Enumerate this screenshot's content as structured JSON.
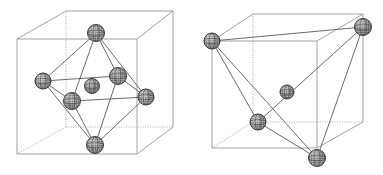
{
  "figure": {
    "background_color": "#ffffff",
    "width": 383,
    "height": 175,
    "colors": {
      "cube_edge_solid": "#8a8a8a",
      "cube_edge_dotted": "#9a9a9a",
      "polyhedron_edge": "#5a5a5a",
      "bond": "#555555",
      "atom_outline": "#2f2f2f",
      "atom_fill": "#b8b8b8"
    }
  },
  "panels": [
    {
      "id": "left",
      "name": "octahedral-site-panel",
      "label": "",
      "cube": {
        "name": "unit-cell-cube-left",
        "corners": {
          "front_top_left": [
            17,
            39
          ],
          "front_top_right": [
            137,
            39
          ],
          "front_bottom_left": [
            17,
            154
          ],
          "front_bottom_right": [
            137,
            154
          ],
          "back_top_left": [
            66,
            11
          ],
          "back_top_right": [
            173,
            11
          ],
          "back_bottom_left": [
            66,
            127
          ],
          "back_bottom_right": [
            173,
            127
          ]
        },
        "solid_edges": [
          [
            "front_top_left",
            "front_top_right"
          ],
          [
            "front_top_left",
            "front_bottom_left"
          ],
          [
            "front_bottom_left",
            "front_bottom_right"
          ],
          [
            "front_top_right",
            "front_bottom_right"
          ],
          [
            "front_top_left",
            "back_top_left"
          ],
          [
            "back_top_left",
            "back_top_right"
          ],
          [
            "front_top_right",
            "back_top_right"
          ],
          [
            "back_top_right",
            "back_bottom_right"
          ],
          [
            "front_bottom_right",
            "back_bottom_right"
          ]
        ],
        "dotted_edges": [
          [
            "back_top_left",
            "back_bottom_left"
          ],
          [
            "back_bottom_left",
            "back_bottom_right"
          ],
          [
            "front_bottom_left",
            "back_bottom_left"
          ]
        ]
      },
      "atoms": [
        {
          "name": "atom-face-top",
          "cx": 96,
          "cy": 33,
          "r": 8.5,
          "role": "vertex"
        },
        {
          "name": "atom-face-left",
          "cx": 43,
          "cy": 81,
          "r": 8.0,
          "role": "vertex"
        },
        {
          "name": "atom-face-front",
          "cx": 72,
          "cy": 101,
          "r": 8.5,
          "role": "vertex"
        },
        {
          "name": "atom-face-back",
          "cx": 118,
          "cy": 76,
          "r": 8.5,
          "role": "vertex"
        },
        {
          "name": "atom-face-right",
          "cx": 146,
          "cy": 97,
          "r": 8.0,
          "role": "vertex"
        },
        {
          "name": "atom-face-bottom",
          "cx": 95,
          "cy": 145,
          "r": 8.5,
          "role": "vertex"
        },
        {
          "name": "atom-center",
          "cx": 92,
          "cy": 86,
          "r": 7.5,
          "role": "center"
        }
      ],
      "polyhedron": {
        "type": "octahedron",
        "edges": [
          [
            "atom-face-top",
            "atom-face-left"
          ],
          [
            "atom-face-top",
            "atom-face-front"
          ],
          [
            "atom-face-top",
            "atom-face-back"
          ],
          [
            "atom-face-top",
            "atom-face-right"
          ],
          [
            "atom-face-bottom",
            "atom-face-left"
          ],
          [
            "atom-face-bottom",
            "atom-face-front"
          ],
          [
            "atom-face-bottom",
            "atom-face-back"
          ],
          [
            "atom-face-bottom",
            "atom-face-right"
          ],
          [
            "atom-face-left",
            "atom-face-front"
          ],
          [
            "atom-face-front",
            "atom-face-right"
          ],
          [
            "atom-face-right",
            "atom-face-back"
          ],
          [
            "atom-face-back",
            "atom-face-left"
          ]
        ]
      }
    },
    {
      "id": "right",
      "name": "tetrahedral-site-panel",
      "label": "",
      "cube": {
        "name": "unit-cell-cube-right",
        "corners": {
          "front_top_left": [
            212,
            41
          ],
          "front_top_right": [
            317,
            41
          ],
          "front_bottom_left": [
            212,
            148
          ],
          "front_bottom_right": [
            317,
            148
          ],
          "back_top_left": [
            253,
            14
          ],
          "back_top_right": [
            363,
            14
          ],
          "back_bottom_left": [
            253,
            122
          ],
          "back_bottom_right": [
            363,
            122
          ]
        },
        "solid_edges": [
          [
            "front_top_left",
            "front_top_right"
          ],
          [
            "front_top_left",
            "front_bottom_left"
          ],
          [
            "front_bottom_left",
            "front_bottom_right"
          ],
          [
            "front_top_right",
            "front_bottom_right"
          ],
          [
            "front_top_left",
            "back_top_left"
          ],
          [
            "back_top_left",
            "back_top_right"
          ],
          [
            "front_top_right",
            "back_top_right"
          ],
          [
            "back_top_right",
            "back_bottom_right"
          ],
          [
            "front_bottom_right",
            "back_bottom_right"
          ]
        ],
        "dotted_edges": [
          [
            "back_top_left",
            "back_bottom_left"
          ],
          [
            "back_bottom_left",
            "back_bottom_right"
          ],
          [
            "front_bottom_left",
            "back_bottom_left"
          ]
        ]
      },
      "atoms": [
        {
          "name": "atom-corner-front-top-left",
          "cx": 212,
          "cy": 41,
          "r": 8.0,
          "role": "vertex"
        },
        {
          "name": "atom-corner-back-top-right",
          "cx": 363,
          "cy": 27,
          "r": 8.5,
          "role": "vertex"
        },
        {
          "name": "atom-corner-back-bottom-left",
          "cx": 258,
          "cy": 122,
          "r": 8.0,
          "role": "vertex"
        },
        {
          "name": "atom-corner-front-bottom-right",
          "cx": 317,
          "cy": 158,
          "r": 8.5,
          "role": "vertex"
        },
        {
          "name": "atom-center",
          "cx": 287,
          "cy": 92,
          "r": 7.0,
          "role": "center"
        }
      ],
      "polyhedron": {
        "type": "tetrahedron",
        "edges": [
          [
            "atom-corner-front-top-left",
            "atom-corner-back-top-right"
          ],
          [
            "atom-corner-front-top-left",
            "atom-corner-back-bottom-left"
          ],
          [
            "atom-corner-front-top-left",
            "atom-corner-front-bottom-right"
          ],
          [
            "atom-corner-back-top-right",
            "atom-corner-back-bottom-left"
          ],
          [
            "atom-corner-back-top-right",
            "atom-corner-front-bottom-right"
          ],
          [
            "atom-corner-back-bottom-left",
            "atom-corner-front-bottom-right"
          ]
        ]
      }
    }
  ]
}
